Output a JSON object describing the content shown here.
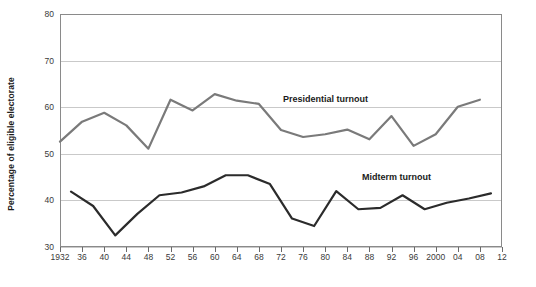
{
  "chart_data": {
    "type": "line",
    "title": "",
    "xlabel": "",
    "ylabel": "Percentage of eligible electorate",
    "ylim": [
      30,
      80
    ],
    "yticks": [
      30,
      40,
      50,
      60,
      70,
      80
    ],
    "xlim": [
      1932,
      2012
    ],
    "grid": true,
    "legend": "inline-annotations",
    "x": [
      1932,
      1936,
      1940,
      1944,
      1948,
      1952,
      1956,
      1960,
      1964,
      1968,
      1972,
      1976,
      1980,
      1984,
      1988,
      1992,
      1996,
      2000,
      2004,
      2008,
      2012
    ],
    "xtick_labels": [
      "1932",
      "36",
      "40",
      "44",
      "48",
      "52",
      "56",
      "60",
      "64",
      "68",
      "72",
      "76",
      "80",
      "84",
      "88",
      "92",
      "96",
      "2000",
      "04",
      "08",
      "12"
    ],
    "series": [
      {
        "name": "Presidential turnout",
        "color": "#7a7a7a",
        "x": [
          1932,
          1936,
          1940,
          1944,
          1948,
          1952,
          1956,
          1960,
          1964,
          1968,
          1972,
          1976,
          1980,
          1984,
          1988,
          1992,
          1996,
          2000,
          2004,
          2008
        ],
        "values": [
          52.6,
          56.9,
          58.8,
          56.1,
          51.1,
          61.6,
          59.3,
          62.8,
          61.4,
          60.7,
          55.1,
          53.6,
          54.2,
          55.2,
          53.1,
          58.1,
          51.7,
          54.2,
          60.1,
          61.6
        ]
      },
      {
        "name": "Midterm turnout",
        "color": "#2b2b2b",
        "x": [
          1934,
          1938,
          1942,
          1946,
          1950,
          1954,
          1958,
          1962,
          1966,
          1970,
          1974,
          1978,
          1982,
          1986,
          1990,
          1994,
          1998,
          2002,
          2006,
          2010
        ],
        "values": [
          41.9,
          38.8,
          32.5,
          37.1,
          41.1,
          41.7,
          43.0,
          45.4,
          45.4,
          43.5,
          36.1,
          34.5,
          42.0,
          38.1,
          38.4,
          41.1,
          38.1,
          39.5,
          40.4,
          41.5
        ]
      }
    ],
    "annotations": [
      {
        "text": "Presidential turnout",
        "series": "presidential"
      },
      {
        "text": "Midterm turnout",
        "series": "midterm"
      }
    ]
  }
}
